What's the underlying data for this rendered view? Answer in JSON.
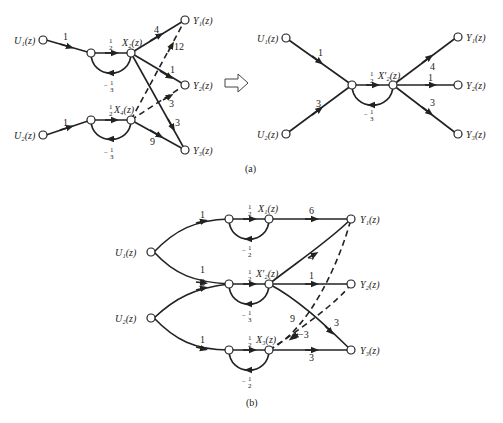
{
  "diagram_a": {
    "caption": "(a)",
    "left": {
      "inputs": [
        "U₁(z)",
        "U₂(z)"
      ],
      "states": [
        "X₂(z)",
        "X₄(z)"
      ],
      "outputs": [
        "Y₁(z)",
        "Y₂(z)",
        "Y₃(z)"
      ],
      "gains": {
        "u1_in": "1",
        "u2_in": "1",
        "x2_forward": "1/2",
        "x2_feedback": "−1/3",
        "x4_forward": "1/2",
        "x4_feedback": "−1/3",
        "x2_y1": "4",
        "x2_y2": "1",
        "x2_y3": "3",
        "x4_y1": "12",
        "x4_y2": "3",
        "x4_y3": "9"
      }
    },
    "arrow": "transform-arrow",
    "right": {
      "inputs": [
        "U₁(z)",
        "U₂(z)"
      ],
      "state": "X′₂(z)",
      "outputs": [
        "Y₁(z)",
        "Y₂(z)",
        "Y₃(z)"
      ],
      "gains": {
        "u1_in": "1",
        "u2_in": "3",
        "forward": "1/2",
        "feedback": "−1/3",
        "y1": "4",
        "y2": "1",
        "y3": "3"
      }
    }
  },
  "diagram_b": {
    "caption": "(b)",
    "inputs": [
      "U₁(z)",
      "U₂(z)"
    ],
    "states": [
      "X₁(z)",
      "X′₂(z)",
      "X₃(z)"
    ],
    "outputs": [
      "Y₁(z)",
      "Y₂(z)",
      "Y₃(z)"
    ],
    "gains": {
      "u1_x1": "1",
      "u1_x2": "1",
      "u2_x2": "3",
      "u2_x3": "1",
      "x1_forward": "1/2",
      "x1_feedback": "−1/2",
      "x2_forward": "1/2",
      "x2_feedback": "−1/3",
      "x3_forward": "1/2",
      "x3_feedback": "−1/2",
      "x1_y1": "6",
      "x2_y1": "4",
      "x2_y2": "1",
      "x2_y3": "3",
      "x3_y1": "9",
      "x3_y2": "−3",
      "x3_y3": "3"
    }
  },
  "labels": {
    "one": "1",
    "three": "3",
    "four": "4",
    "six": "6",
    "nine": "9",
    "twelve": "12",
    "neg_three": "−3",
    "half_num": "1",
    "half_den": "2",
    "third_den": "3",
    "minus": "−"
  }
}
